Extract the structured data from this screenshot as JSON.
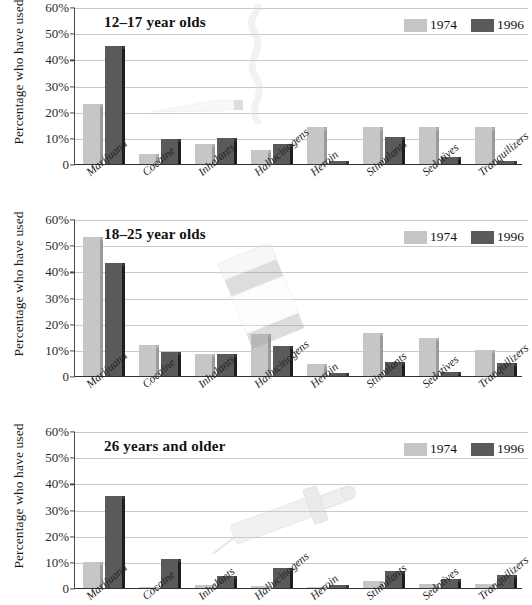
{
  "figure": {
    "y_axis_title": "Percentage who have used",
    "legend": [
      {
        "label": "1974",
        "color": "#c6c6c6",
        "swatch": "legend-swatch-1974"
      },
      {
        "label": "1996",
        "color": "#5a5a5a",
        "swatch": "legend-swatch-1996"
      }
    ],
    "decorations": [
      {
        "name": "cigarette-smoke-illustration"
      },
      {
        "name": "marijuana-joint-illustration"
      },
      {
        "name": "pill-bottle-illustration"
      },
      {
        "name": "syringe-illustration"
      }
    ]
  },
  "chart_data": [
    {
      "type": "bar",
      "title": "12–17 year olds",
      "xlabel": "",
      "ylabel": "Percentage who have used",
      "ylim": [
        0,
        60
      ],
      "yticks": [
        0,
        10,
        20,
        30,
        40,
        50,
        60
      ],
      "ytick_labels": [
        "0",
        "10%",
        "20%",
        "30%",
        "40%",
        "50%",
        "60%"
      ],
      "grid": true,
      "legend_position": "top-right",
      "categories": [
        "Marijuana",
        "Cocaine",
        "Inhalants",
        "Hallucinogens",
        "Heroin",
        "Stimulants",
        "Sedatives",
        "Tranquilizers"
      ],
      "series": [
        {
          "name": "1974",
          "color": "#c6c6c6",
          "values": [
            23,
            4,
            7.5,
            5.5,
            14,
            14,
            14,
            14
          ]
        },
        {
          "name": "1996",
          "color": "#5a5a5a",
          "values": [
            45,
            9.5,
            10,
            7.5,
            1,
            10.5,
            2.5,
            1
          ]
        }
      ]
    },
    {
      "type": "bar",
      "title": "18–25 year olds",
      "xlabel": "",
      "ylabel": "Percentage who have used",
      "ylim": [
        0,
        60
      ],
      "yticks": [
        0,
        10,
        20,
        30,
        40,
        50,
        60
      ],
      "ytick_labels": [
        "0",
        "10%",
        "20%",
        "30%",
        "40%",
        "50%",
        "60%"
      ],
      "grid": true,
      "legend_position": "top-right",
      "categories": [
        "Marijuana",
        "Cocaine",
        "Inhalants",
        "Hallucinogens",
        "Heroin",
        "Stimulants",
        "Sedatives",
        "Tranquilizers"
      ],
      "series": [
        {
          "name": "1974",
          "color": "#c6c6c6",
          "values": [
            53,
            12,
            8.5,
            16,
            4.5,
            16.5,
            14.5,
            10
          ]
        },
        {
          "name": "1996",
          "color": "#5a5a5a",
          "values": [
            43,
            9,
            8.5,
            11.5,
            1,
            5.5,
            1.5,
            5
          ]
        }
      ]
    },
    {
      "type": "bar",
      "title": "26 years and older",
      "xlabel": "",
      "ylabel": "Percentage who have used",
      "ylim": [
        0,
        60
      ],
      "yticks": [
        0,
        10,
        20,
        30,
        40,
        50,
        60
      ],
      "ytick_labels": [
        "0",
        "10%",
        "20%",
        "30%",
        "40%",
        "50%",
        "60%"
      ],
      "grid": true,
      "legend_position": "top-right",
      "categories": [
        "Marijuana",
        "Cocaine",
        "Inhalants",
        "Hallucinogens",
        "Heroin",
        "Stimulants",
        "Sedatives",
        "Tranquilizers"
      ],
      "series": [
        {
          "name": "1974",
          "color": "#c6c6c6",
          "values": [
            10,
            0.5,
            1,
            0.8,
            0.3,
            2.5,
            1.5,
            1.5
          ]
        },
        {
          "name": "1996",
          "color": "#5a5a5a",
          "values": [
            35,
            11,
            4.5,
            7.5,
            1,
            6.5,
            3.5,
            5
          ]
        }
      ]
    }
  ]
}
